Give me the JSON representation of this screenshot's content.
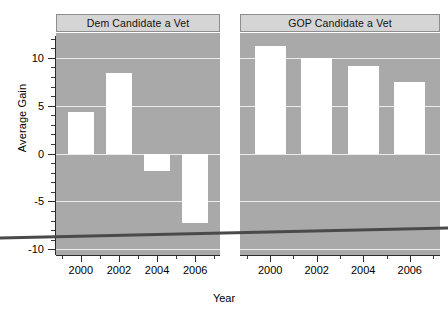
{
  "chart_data": {
    "type": "bar",
    "title": "",
    "xlabel": "Year",
    "ylabel": "Average Gain",
    "ylim": [
      -10.6,
      12.6
    ],
    "xlim": [
      1998.7,
      2007.3
    ],
    "grid": true,
    "legend_position": "none",
    "facets": [
      {
        "label": "Dem Candidate a Vet",
        "categories": [
          "2000",
          "2002",
          "2004",
          "2006"
        ],
        "x": [
          2000,
          2002,
          2004,
          2006
        ],
        "values": [
          4.3,
          8.4,
          -1.8,
          -7.3
        ]
      },
      {
        "label": "GOP Candidate a Vet",
        "categories": [
          "2000",
          "2002",
          "2004",
          "2006"
        ],
        "x": [
          2000,
          2002,
          2004,
          2006
        ],
        "values": [
          11.2,
          10.0,
          9.1,
          7.5
        ]
      }
    ],
    "y_ticks": [
      10,
      5,
      0,
      -5,
      -10
    ],
    "y_tick_labels": [
      "10",
      "5",
      "0",
      "-5",
      "-10"
    ],
    "x_ticks": [
      2000,
      2002,
      2004,
      2006
    ],
    "x_tick_labels": [
      "2000",
      "2002",
      "2004",
      "2006"
    ],
    "colors": {
      "panel_background": "#a9a9a9",
      "bar_fill": "#ffffff",
      "gridline": "#f2f2f2",
      "strip_background": "#d5d5d5",
      "strip_border": "#8e8e8e",
      "axis": "#2b2b2b",
      "page_background": "#ffffff",
      "overlay_line": "#4a4a4a"
    },
    "annotations": [
      {
        "name": "scan-artifact-line",
        "description": "dark near-horizontal line crossing the full image width",
        "x0": 0,
        "y0": 238,
        "x1": 448,
        "y1": 228
      }
    ]
  },
  "axes": {
    "y_title": "Average Gain",
    "x_title": "Year"
  },
  "panels": {
    "left_title": "Dem Candidate a Vet",
    "right_title": "GOP Candidate a Vet"
  }
}
